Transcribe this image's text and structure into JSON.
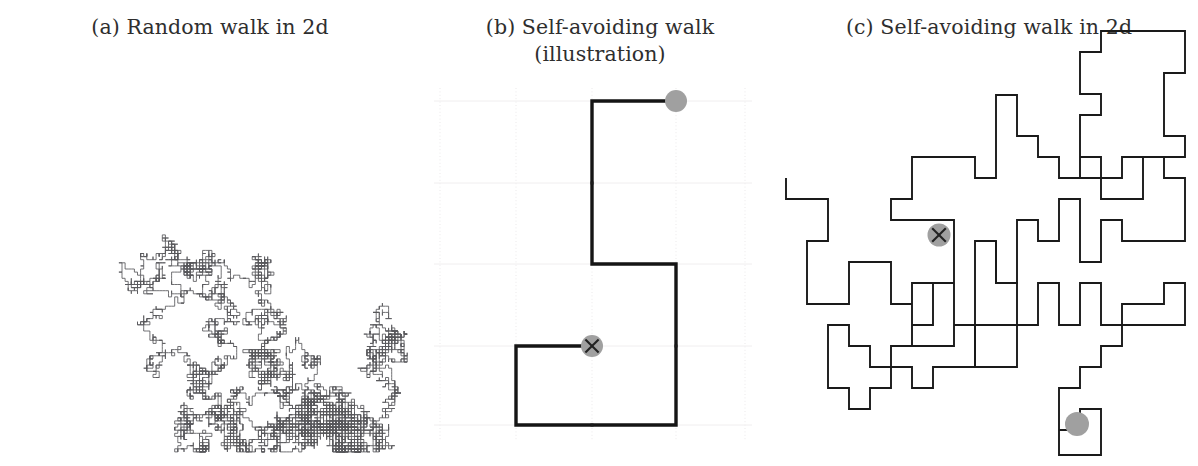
{
  "figure": {
    "background": "#ffffff",
    "panel_count": 3
  },
  "panels": [
    {
      "id": "a",
      "caption": "(a) Random walk in 2d",
      "type": "lattice-random-walk",
      "description": "Dense self-intersecting random walk on a square lattice"
    },
    {
      "id": "b",
      "caption": "(b) Self-avoiding walk\n(illustration)",
      "type": "lattice-self-avoiding-walk-illustration",
      "description": "Short self-avoiding walk drawn on a faint square grid"
    },
    {
      "id": "c",
      "caption": "(c) Self-avoiding walk in 2d",
      "type": "lattice-self-avoiding-walk",
      "description": "Long self-avoiding walk on a square lattice"
    }
  ],
  "markers": {
    "start_name": "start-marker-x",
    "end_name": "end-marker-dot",
    "circle_color": "#a0a0a0",
    "x_color": "#222222"
  },
  "colors": {
    "walk_a_stroke": "#58585c",
    "walk_b_stroke": "#151515",
    "walk_c_stroke": "#1a1a1a",
    "gridline": "#ebe9ea",
    "caption_text": "#2e2e2e"
  },
  "chart_data": {
    "type": "line",
    "panels": [
      {
        "label": "(a) Random walk in 2d",
        "lattice_step": 3.1,
        "bounds": {
          "x": [
            20,
            410
          ],
          "y": [
            55,
            452
          ]
        },
        "seed": 20250117,
        "steps": 9000,
        "self_avoiding": false
      },
      {
        "label": "(b) Self-avoiding walk (illustration)",
        "lattice_step_x": 84,
        "lattice_step_y": 81,
        "grid_x": [
          440,
          516,
          592,
          676,
          745
        ],
        "grid_y": [
          101,
          183,
          264,
          346,
          425
        ],
        "vertices": [
          [
            592,
            346
          ],
          [
            516,
            346
          ],
          [
            516,
            425
          ],
          [
            676,
            425
          ],
          [
            676,
            264
          ],
          [
            592,
            264
          ],
          [
            592,
            101
          ],
          [
            676,
            101
          ]
        ],
        "start": [
          592,
          346
        ],
        "end": [
          676,
          101
        ],
        "self_avoiding": true,
        "steps": 7
      },
      {
        "label": "(c) Self-avoiding walk in 2d",
        "lattice_step": 21,
        "bounds": {
          "x": [
            786,
            1185
          ],
          "y": [
            73,
            455
          ]
        },
        "start": [
          1104,
          423
        ],
        "end": [
          1104,
          423
        ],
        "start_marker": [
          1096,
          235
        ],
        "self_avoiding": true,
        "steps": 196
      }
    ],
    "xlabel": "",
    "ylabel": "",
    "grid": true,
    "legend": "none"
  }
}
